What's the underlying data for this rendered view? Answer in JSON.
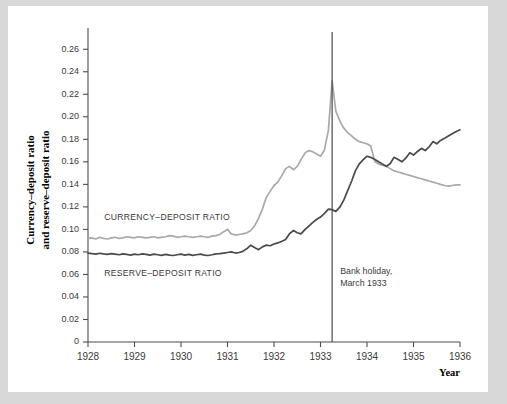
{
  "figure": {
    "y_axis_title_line1": "Currency–deposit ratio",
    "y_axis_title_line2": "and reserve–deposit ratio",
    "x_axis_title": "Year",
    "annotation_line1": "Bank holiday,",
    "annotation_line2": "March 1933",
    "label_currency": "CURRENCY–DEPOSIT RATIO",
    "label_reserve": "RESERVE–DEPOSIT RATIO"
  },
  "colors": {
    "currency_line": "#a9a9a9",
    "reserve_line": "#4a4a4a",
    "axis": "#4d4d4d",
    "page_background": "#d8d8d8",
    "figure_background": "#ffffff"
  },
  "chart_data": {
    "type": "line",
    "title": "",
    "xlabel": "Year",
    "ylabel": "Currency–deposit ratio and reserve–deposit ratio",
    "xlim": [
      1928,
      1936
    ],
    "ylim": [
      0,
      0.27
    ],
    "grid": false,
    "legend": "inline-labels",
    "yticks": [
      0,
      0.02,
      0.04,
      0.06,
      0.08,
      0.1,
      0.12,
      0.14,
      0.16,
      0.18,
      0.2,
      0.22,
      0.24,
      0.26
    ],
    "ytick_labels": [
      "0",
      "0.02",
      "0.04",
      "0.06",
      "0.08",
      "0.10",
      "0.12",
      "0.14",
      "0.16",
      "0.18",
      "0.20",
      "0.22",
      "0.24",
      "0.26"
    ],
    "xticks": [
      1928,
      1929,
      1930,
      1931,
      1932,
      1933,
      1934,
      1935,
      1936
    ],
    "xtick_labels": [
      "1928",
      "1929",
      "1930",
      "1931",
      "1932",
      "1933",
      "1934",
      "1935",
      "1936"
    ],
    "annotations": [
      {
        "type": "vline",
        "x": 1933.25,
        "label": "Bank holiday, March 1933"
      }
    ],
    "series": [
      {
        "name": "CURRENCY–DEPOSIT RATIO",
        "color": "#a9a9a9",
        "x": [
          1928.0,
          1928.08,
          1928.17,
          1928.25,
          1928.33,
          1928.42,
          1928.5,
          1928.58,
          1928.67,
          1928.75,
          1928.83,
          1928.92,
          1929.0,
          1929.08,
          1929.17,
          1929.25,
          1929.33,
          1929.42,
          1929.5,
          1929.58,
          1929.67,
          1929.75,
          1929.83,
          1929.92,
          1930.0,
          1930.08,
          1930.17,
          1930.25,
          1930.33,
          1930.42,
          1930.5,
          1930.58,
          1930.67,
          1930.75,
          1930.83,
          1930.92,
          1931.0,
          1931.08,
          1931.17,
          1931.25,
          1931.33,
          1931.42,
          1931.5,
          1931.58,
          1931.67,
          1931.75,
          1931.83,
          1931.92,
          1932.0,
          1932.08,
          1932.17,
          1932.25,
          1932.33,
          1932.42,
          1932.5,
          1932.58,
          1932.67,
          1932.75,
          1932.83,
          1932.92,
          1933.0,
          1933.08,
          1933.17,
          1933.25,
          1933.33,
          1933.42,
          1933.5,
          1933.58,
          1933.67,
          1933.75,
          1933.83,
          1933.92,
          1934.0,
          1934.08,
          1934.17,
          1934.25,
          1934.33,
          1934.42,
          1934.5,
          1934.58,
          1934.67,
          1934.75,
          1934.83,
          1934.92,
          1935.0,
          1935.08,
          1935.17,
          1935.25,
          1935.33,
          1935.42,
          1935.5,
          1935.58,
          1935.67,
          1935.75,
          1935.83,
          1935.92,
          1936.0
        ],
        "values": [
          0.092,
          0.0925,
          0.0915,
          0.093,
          0.092,
          0.0915,
          0.0925,
          0.093,
          0.092,
          0.0925,
          0.0935,
          0.093,
          0.0925,
          0.0935,
          0.093,
          0.0925,
          0.093,
          0.0935,
          0.0925,
          0.093,
          0.0935,
          0.0945,
          0.094,
          0.093,
          0.0935,
          0.094,
          0.0935,
          0.093,
          0.0935,
          0.094,
          0.0935,
          0.093,
          0.094,
          0.0945,
          0.0955,
          0.098,
          0.1,
          0.096,
          0.095,
          0.0955,
          0.096,
          0.097,
          0.099,
          0.103,
          0.11,
          0.118,
          0.128,
          0.134,
          0.139,
          0.142,
          0.148,
          0.154,
          0.156,
          0.153,
          0.156,
          0.162,
          0.168,
          0.17,
          0.169,
          0.167,
          0.165,
          0.17,
          0.188,
          0.232,
          0.205,
          0.196,
          0.19,
          0.186,
          0.183,
          0.18,
          0.178,
          0.177,
          0.176,
          0.174,
          0.16,
          0.158,
          0.157,
          0.156,
          0.154,
          0.152,
          0.151,
          0.15,
          0.149,
          0.148,
          0.147,
          0.146,
          0.145,
          0.144,
          0.143,
          0.142,
          0.141,
          0.14,
          0.139,
          0.1385,
          0.139,
          0.1395,
          0.1395
        ]
      },
      {
        "name": "RESERVE–DEPOSIT RATIO",
        "color": "#4a4a4a",
        "x": [
          1928.0,
          1928.08,
          1928.17,
          1928.25,
          1928.33,
          1928.42,
          1928.5,
          1928.58,
          1928.67,
          1928.75,
          1928.83,
          1928.92,
          1929.0,
          1929.08,
          1929.17,
          1929.25,
          1929.33,
          1929.42,
          1929.5,
          1929.58,
          1929.67,
          1929.75,
          1929.83,
          1929.92,
          1930.0,
          1930.08,
          1930.17,
          1930.25,
          1930.33,
          1930.42,
          1930.5,
          1930.58,
          1930.67,
          1930.75,
          1930.83,
          1930.92,
          1931.0,
          1931.08,
          1931.17,
          1931.25,
          1931.33,
          1931.42,
          1931.5,
          1931.58,
          1931.67,
          1931.75,
          1931.83,
          1931.92,
          1932.0,
          1932.08,
          1932.17,
          1932.25,
          1932.33,
          1932.42,
          1932.5,
          1932.58,
          1932.67,
          1932.75,
          1932.83,
          1932.92,
          1933.0,
          1933.08,
          1933.17,
          1933.25,
          1933.33,
          1933.42,
          1933.5,
          1933.58,
          1933.67,
          1933.75,
          1933.83,
          1933.92,
          1934.0,
          1934.08,
          1934.17,
          1934.25,
          1934.33,
          1934.42,
          1934.5,
          1934.58,
          1934.67,
          1934.75,
          1934.83,
          1934.92,
          1935.0,
          1935.08,
          1935.17,
          1935.25,
          1935.33,
          1935.42,
          1935.5,
          1935.58,
          1935.67,
          1935.75,
          1935.83,
          1935.92,
          1936.0
        ],
        "values": [
          0.079,
          0.0785,
          0.078,
          0.0788,
          0.0782,
          0.0778,
          0.0785,
          0.078,
          0.0775,
          0.0782,
          0.0778,
          0.0772,
          0.078,
          0.0775,
          0.0782,
          0.0778,
          0.0772,
          0.078,
          0.0775,
          0.077,
          0.0778,
          0.0772,
          0.0768,
          0.0775,
          0.078,
          0.0772,
          0.0778,
          0.077,
          0.0775,
          0.078,
          0.0772,
          0.0768,
          0.0775,
          0.0782,
          0.0785,
          0.079,
          0.0795,
          0.08,
          0.079,
          0.0795,
          0.0805,
          0.083,
          0.086,
          0.084,
          0.082,
          0.0845,
          0.086,
          0.0855,
          0.087,
          0.088,
          0.0895,
          0.091,
          0.096,
          0.099,
          0.097,
          0.096,
          0.1,
          0.103,
          0.106,
          0.109,
          0.111,
          0.114,
          0.118,
          0.1175,
          0.116,
          0.12,
          0.126,
          0.134,
          0.143,
          0.152,
          0.158,
          0.162,
          0.165,
          0.164,
          0.162,
          0.16,
          0.158,
          0.156,
          0.1585,
          0.164,
          0.162,
          0.16,
          0.163,
          0.168,
          0.166,
          0.169,
          0.172,
          0.17,
          0.173,
          0.178,
          0.176,
          0.179,
          0.181,
          0.183,
          0.185,
          0.187,
          0.1885
        ]
      }
    ]
  }
}
